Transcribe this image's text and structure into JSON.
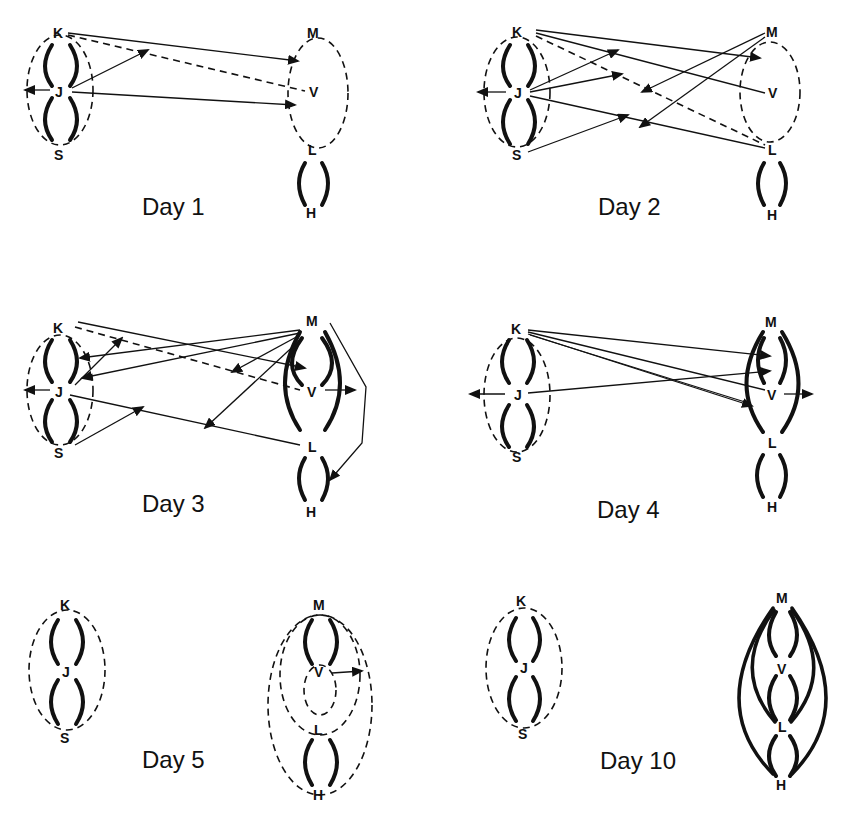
{
  "figure": {
    "panels": [
      {
        "id": "day1",
        "caption": "Day 1",
        "left_group": [
          "K",
          "J",
          "S"
        ],
        "right_group": [
          "M",
          "V",
          "L",
          "H"
        ]
      },
      {
        "id": "day2",
        "caption": "Day 2",
        "left_group": [
          "K",
          "J",
          "S"
        ],
        "right_group": [
          "M",
          "V",
          "L",
          "H"
        ]
      },
      {
        "id": "day3",
        "caption": "Day 3",
        "left_group": [
          "K",
          "J",
          "S"
        ],
        "right_group": [
          "M",
          "V",
          "L",
          "H"
        ]
      },
      {
        "id": "day4",
        "caption": "Day 4",
        "left_group": [
          "K",
          "J",
          "S"
        ],
        "right_group": [
          "M",
          "V",
          "L",
          "H"
        ]
      },
      {
        "id": "day5",
        "caption": "Day 5",
        "left_group": [
          "K",
          "J",
          "S"
        ],
        "right_group": [
          "M",
          "V",
          "L",
          "H"
        ]
      },
      {
        "id": "day10",
        "caption": "Day 10",
        "left_group": [
          "K",
          "J",
          "S"
        ],
        "right_group": [
          "M",
          "V",
          "L",
          "H"
        ]
      }
    ],
    "labels": {
      "K": "K",
      "J": "J",
      "S": "S",
      "M": "M",
      "V": "V",
      "L": "L",
      "H": "H"
    },
    "legend_hint": {
      "solid_arrow": "directed interaction",
      "dashed_line": "weak association",
      "thick_arc": "strong bond"
    }
  }
}
